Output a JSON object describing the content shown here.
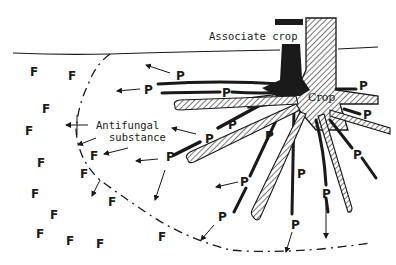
{
  "diagram": {
    "labels": {
      "associate_crop": "Associate crop",
      "crop": "Crop",
      "antifungal_line1": "Antifungal",
      "antifungal_line2": "substance"
    },
    "legend_letters": {
      "producer": "P",
      "fungus": "F"
    },
    "colors": {
      "ink": "#1a1a1a",
      "background": "#ffffff"
    },
    "p_markers": [
      {
        "x": 176,
        "y": 81
      },
      {
        "x": 144,
        "y": 93
      },
      {
        "x": 221,
        "y": 96
      },
      {
        "x": 228,
        "y": 126
      },
      {
        "x": 202,
        "y": 138
      },
      {
        "x": 164,
        "y": 159
      },
      {
        "x": 358,
        "y": 86
      },
      {
        "x": 362,
        "y": 118
      },
      {
        "x": 349,
        "y": 154
      },
      {
        "x": 240,
        "y": 186
      },
      {
        "x": 217,
        "y": 218
      },
      {
        "x": 298,
        "y": 175
      },
      {
        "x": 323,
        "y": 194
      },
      {
        "x": 292,
        "y": 226
      },
      {
        "x": 209,
        "y": 138
      },
      {
        "x": 209,
        "y": 157
      }
    ],
    "f_markers": [
      {
        "x": 30,
        "y": 75
      },
      {
        "x": 68,
        "y": 79
      },
      {
        "x": 42,
        "y": 112
      },
      {
        "x": 26,
        "y": 134
      },
      {
        "x": 90,
        "y": 155
      },
      {
        "x": 37,
        "y": 167
      },
      {
        "x": 80,
        "y": 176
      },
      {
        "x": 30,
        "y": 197
      },
      {
        "x": 108,
        "y": 203
      },
      {
        "x": 50,
        "y": 217
      },
      {
        "x": 36,
        "y": 237
      },
      {
        "x": 66,
        "y": 245
      },
      {
        "x": 96,
        "y": 248
      },
      {
        "x": 158,
        "y": 239
      },
      {
        "x": 160,
        "y": 110
      }
    ]
  }
}
